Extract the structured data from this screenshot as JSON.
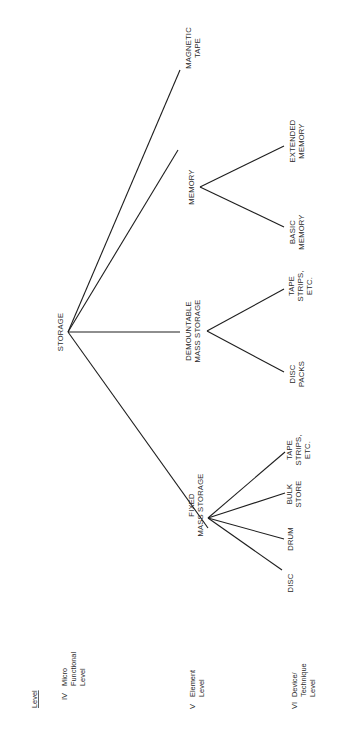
{
  "levels": {
    "header": "Level",
    "items": [
      {
        "roman": "IV",
        "lines": [
          "Micro",
          "Functional",
          "Level"
        ]
      },
      {
        "roman": "V",
        "lines": [
          "Element",
          "Level"
        ]
      },
      {
        "roman": "VI",
        "lines": [
          "Device/",
          "Technique",
          "Level"
        ]
      }
    ]
  },
  "tree": {
    "root": "STORAGE",
    "fixed": {
      "lines": [
        "FIXED",
        "MASS STORAGE"
      ]
    },
    "demountable": {
      "lines": [
        "DEMOUNTABLE",
        "MASS STORAGE"
      ]
    },
    "memory": {
      "lines": [
        "MEMORY"
      ]
    },
    "magnetic_tape": {
      "lines": [
        "MAGNETIC",
        "TAPE"
      ]
    },
    "fixed_children": [
      {
        "lines": [
          "DISC"
        ]
      },
      {
        "lines": [
          "DRUM"
        ]
      },
      {
        "lines": [
          "BULK",
          "STORE"
        ]
      },
      {
        "lines": [
          "TAPE",
          "STRIPS,",
          "ETC."
        ]
      }
    ],
    "demountable_children": [
      {
        "lines": [
          "DISC",
          "PACKS"
        ]
      },
      {
        "lines": [
          "TAPE",
          "STRIPS,",
          "ETC."
        ]
      }
    ],
    "memory_children": [
      {
        "lines": [
          "BASIC",
          "MEMORY"
        ]
      },
      {
        "lines": [
          "EXTENDED",
          "MEMORY"
        ]
      }
    ]
  }
}
